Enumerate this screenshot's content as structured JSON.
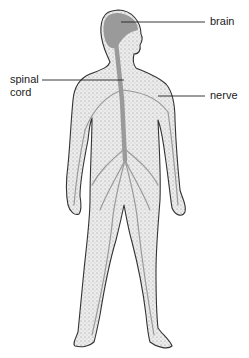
{
  "diagram": {
    "labels": {
      "brain": "brain",
      "spinal_cord_line1": "spinal",
      "spinal_cord_line2": "cord",
      "nerve": "nerve"
    },
    "colors": {
      "body_fill": "#e4e4e4",
      "outline": "#333333",
      "nervous_system": "#9a9a9a",
      "leader_line": "#222222"
    }
  }
}
